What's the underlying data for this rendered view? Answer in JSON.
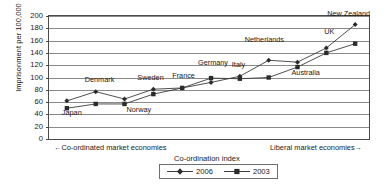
{
  "chart_data": {
    "type": "line",
    "title": "",
    "xlabel": "Co-ordination index",
    "ylabel": "Imprisonment per 100,000",
    "ylim": [
      0,
      200
    ],
    "yticks": [
      "200",
      "180",
      "160",
      "140",
      "120",
      "100",
      "80",
      "60",
      "40",
      "20",
      "0"
    ],
    "grid": true,
    "legend_position": "bottom-center",
    "categories": [
      "Japan",
      "Denmark",
      "Norway",
      "Sweden",
      "France",
      "Germany",
      "Italy",
      "Netherlands",
      "Australia",
      "UK",
      "New Zealand"
    ],
    "series": [
      {
        "name": "2006",
        "marker": "diamond",
        "values": [
          62,
          77,
          65,
          81,
          83,
          92,
          102,
          128,
          125,
          148,
          186
        ]
      },
      {
        "name": "2003",
        "marker": "square",
        "values": [
          50,
          57,
          57,
          73,
          83,
          99,
          98,
          100,
          117,
          140,
          155
        ]
      }
    ],
    "annotations": [
      {
        "text": "Japan",
        "series": "2006",
        "index": 0
      },
      {
        "text": "Denmark",
        "series": "2006",
        "index": 1
      },
      {
        "text": "Norway",
        "series": "2006",
        "index": 2
      },
      {
        "text": "Sweden",
        "series": "2006",
        "index": 3
      },
      {
        "text": "France",
        "series": "2006",
        "index": 4
      },
      {
        "text": "Germany",
        "series": "2006",
        "index": 5
      },
      {
        "text": "Italy",
        "series": "2006",
        "index": 6
      },
      {
        "text": "Netherlands",
        "series": "2006",
        "index": 7
      },
      {
        "text": "Australia",
        "series": "2006",
        "index": 8
      },
      {
        "text": "UK",
        "series": "2006",
        "index": 9
      },
      {
        "text": "New Zealand",
        "series": "2006",
        "index": 10
      }
    ],
    "axis_notes": {
      "left": "←Co-ordinated market economies",
      "right": "Liberal market economies→"
    }
  },
  "legend": {
    "items": [
      {
        "label": "2006"
      },
      {
        "label": "2003"
      }
    ]
  },
  "colors": {
    "line": "#3c3c3c",
    "grid": "#8a8a8a",
    "axis": "#4a4a4a",
    "text": "#1a1a1a"
  }
}
